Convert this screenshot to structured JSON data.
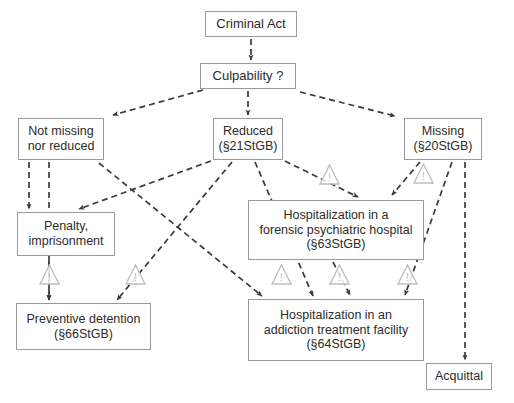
{
  "diagram": {
    "colors": {
      "box_border": "#9a9a9a",
      "text": "#2b2b2b",
      "edge": "#3a3a3a",
      "warning_icon": "#bfbfbf",
      "background": "#ffffff"
    },
    "nodes": [
      {
        "id": "criminal-act",
        "label": "Criminal Act",
        "x": 205,
        "y": 11,
        "w": 92,
        "h": 26,
        "font": 13
      },
      {
        "id": "culpability",
        "label": "Culpability ?",
        "x": 200,
        "y": 63,
        "w": 96,
        "h": 26,
        "font": 13
      },
      {
        "id": "not-missing-nor-reduced",
        "label": "Not missing\nnor reduced",
        "x": 18,
        "y": 118,
        "w": 86,
        "h": 42,
        "font": 12.5
      },
      {
        "id": "reduced",
        "label": "Reduced\n(§21StGB)",
        "x": 213,
        "y": 118,
        "w": 70,
        "h": 42,
        "font": 12.5
      },
      {
        "id": "missing",
        "label": "Missing\n(§20StGB)",
        "x": 404,
        "y": 118,
        "w": 78,
        "h": 42,
        "font": 12.5
      },
      {
        "id": "penalty",
        "label": "Penalty,\nimprisonment",
        "x": 17,
        "y": 212,
        "w": 98,
        "h": 44,
        "font": 12.5
      },
      {
        "id": "forensic-hospital",
        "label": "Hospitalization in a\nforensic psychiatric hospital\n(§63StGB)",
        "x": 248,
        "y": 200,
        "w": 176,
        "h": 60,
        "font": 12.5
      },
      {
        "id": "preventive-detention",
        "label": "Preventive detention\n(§66StGB)",
        "x": 16,
        "y": 303,
        "w": 135,
        "h": 47,
        "font": 12.5
      },
      {
        "id": "addiction-facility",
        "label": "Hospitalization in an\naddiction treatment facility\n(§64StGB)",
        "x": 248,
        "y": 299,
        "w": 176,
        "h": 62,
        "font": 12.5
      },
      {
        "id": "acquittal",
        "label": "Acquittal",
        "x": 426,
        "y": 363,
        "w": 66,
        "h": 27,
        "font": 12.5
      }
    ],
    "edges": [
      {
        "id": "criminal-act-to-culpability",
        "from": "criminal-act",
        "to": "culpability",
        "points": "251,39 251,60"
      },
      {
        "id": "culpability-to-not-missing",
        "from": "culpability",
        "to": "not-missing-nor-reduced",
        "points": "203,90 113,115"
      },
      {
        "id": "culpability-to-reduced",
        "from": "culpability",
        "to": "reduced",
        "points": "248,91 248,115"
      },
      {
        "id": "culpability-to-missing",
        "from": "culpability",
        "to": "missing",
        "points": "300,92 395,116"
      },
      {
        "id": "not-missing-to-penalty",
        "from": "not-missing-nor-reduced",
        "to": "penalty",
        "points": "29,162 29,209"
      },
      {
        "id": "not-missing-to-preventive-detention",
        "from": "not-missing-nor-reduced",
        "to": "preventive-detention",
        "points": "49,162 49,300"
      },
      {
        "id": "reduced-to-penalty",
        "from": "reduced",
        "to": "penalty",
        "points": "211,161 79,209"
      },
      {
        "id": "reduced-to-preventive-detention",
        "from": "reduced",
        "to": "preventive-detention",
        "points": "232,162 117,300"
      },
      {
        "id": "reduced-to-addiction-facility",
        "from": "reduced",
        "to": "addiction-facility",
        "points": "255,162 313,296"
      },
      {
        "id": "reduced-to-forensic-hospital",
        "from": "reduced",
        "to": "forensic-hospital",
        "points": "285,161 358,197"
      },
      {
        "id": "not-missing-to-addiction-facility",
        "from": "not-missing-nor-reduced",
        "to": "addiction-facility",
        "points": "99,163 262,296"
      },
      {
        "id": "missing-to-forensic-hospital",
        "from": "missing",
        "to": "forensic-hospital",
        "points": "420,162 392,195"
      },
      {
        "id": "missing-to-addiction-facility",
        "from": "missing",
        "to": "addiction-facility",
        "points": "452,162 405,295"
      },
      {
        "id": "missing-to-acquittal",
        "from": "missing",
        "to": "acquittal",
        "points": "465,162 465,360"
      },
      {
        "id": "forensic-hospital-to-addiction-facility",
        "from": "forensic-hospital",
        "to": "addiction-facility",
        "points": "333,262 350,295"
      },
      {
        "id": "penalty-to-preventive-detention",
        "from": "penalty",
        "to": "preventive-detention",
        "points": "49,258 49,300"
      }
    ],
    "warning_icons": [
      {
        "id": "warning-reduced-forensic",
        "on_edge": "reduced-to-forensic-hospital",
        "x": 320,
        "y": 165,
        "size": 19
      },
      {
        "id": "warning-missing-forensic",
        "on_edge": "missing-to-forensic-hospital",
        "x": 414,
        "y": 164,
        "size": 19
      },
      {
        "id": "warning-penalty-preventive",
        "on_edge": "penalty-to-preventive-detention",
        "x": 40,
        "y": 265,
        "size": 19
      },
      {
        "id": "warning-reduced-preventive",
        "on_edge": "reduced-to-preventive-detention",
        "x": 126,
        "y": 265,
        "size": 19
      },
      {
        "id": "warning-notmissing-addiction",
        "on_edge": "not-missing-to-addiction-facility",
        "x": 272,
        "y": 265,
        "size": 19
      },
      {
        "id": "warning-forensic-addiction",
        "on_edge": "forensic-hospital-to-addiction-facility",
        "x": 330,
        "y": 265,
        "size": 19
      },
      {
        "id": "warning-missing-addiction",
        "on_edge": "missing-to-addiction-facility",
        "x": 398,
        "y": 265,
        "size": 19
      }
    ]
  }
}
